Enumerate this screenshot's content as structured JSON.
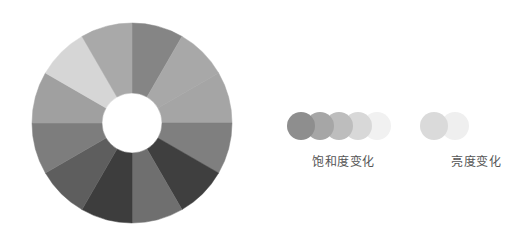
{
  "color_wheel": {
    "center": [
      132,
      123
    ],
    "outer_radius": 100,
    "inner_radius": 30,
    "segments": [
      {
        "index": 0,
        "color": "#858585"
      },
      {
        "index": 1,
        "color": "#a8a8a8"
      },
      {
        "index": 2,
        "color": "#a5a5a5"
      },
      {
        "index": 3,
        "color": "#7f7f7f"
      },
      {
        "index": 4,
        "color": "#3f3f3f"
      },
      {
        "index": 5,
        "color": "#6f6f6f"
      },
      {
        "index": 6,
        "color": "#3d3d3d"
      },
      {
        "index": 7,
        "color": "#5e5e5e"
      },
      {
        "index": 8,
        "color": "#7d7d7d"
      },
      {
        "index": 9,
        "color": "#a0a0a0"
      },
      {
        "index": 10,
        "color": "#d6d6d6"
      },
      {
        "index": 11,
        "color": "#a9a9a9"
      }
    ]
  },
  "saturation": {
    "label": "饱和度变化",
    "circles": [
      "#8e8e8e",
      "#a6a6a6",
      "#bdbdbd",
      "#d8d8d8",
      "#f1f1f1"
    ]
  },
  "brightness": {
    "label": "亮度变化",
    "circles": [
      "#dadada",
      "#efefef"
    ]
  }
}
